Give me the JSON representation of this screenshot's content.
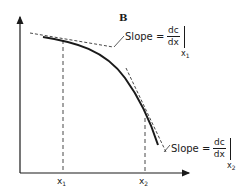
{
  "figure": {
    "panel_label": "B",
    "axis_color": "#1a1a1a",
    "curve_color": "#1a1a1a",
    "annotations": [
      {
        "id": "slope1",
        "prefix": "Slope =",
        "numerator": "dc",
        "denominator": "dx",
        "eval_var": "x",
        "eval_sub": "1"
      },
      {
        "id": "slope2",
        "prefix": "Slope =",
        "numerator": "dc",
        "denominator": "dx",
        "eval_var": "x",
        "eval_sub": "2"
      }
    ],
    "x_ticks": [
      {
        "var": "x",
        "sub": "1"
      },
      {
        "var": "x",
        "sub": "2"
      }
    ]
  }
}
